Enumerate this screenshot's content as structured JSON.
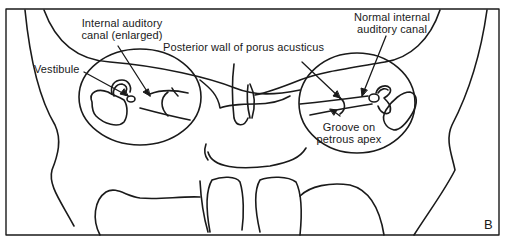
{
  "figure": {
    "panel_letter": "B",
    "stroke_color": "#1a1a1a",
    "background": "#ffffff"
  },
  "labels": {
    "internal_auditory_canal_enlarged": [
      "Internal auditory",
      "canal (enlarged)"
    ],
    "vestibule": "Vestibule",
    "posterior_wall": "Posterior wall of porus acusticus",
    "normal_internal_auditory_canal": [
      "Normal internal",
      "auditory canal"
    ],
    "groove_on_petrous_apex": [
      "Groove on",
      "petrous apex"
    ]
  }
}
